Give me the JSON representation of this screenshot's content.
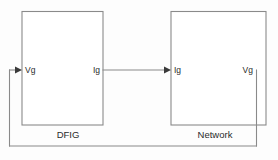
{
  "diagram": {
    "type": "block-diagram",
    "background_color": "#fdfdfd",
    "line_color": "#8a8a8a",
    "text_color": "#2b2b2b",
    "arrow_color": "#3a3a3a",
    "blocks": [
      {
        "id": "dfig",
        "caption": "DFIG",
        "ports": {
          "input_label": "Vg",
          "output_label": "Ig"
        }
      },
      {
        "id": "network",
        "caption": "Network",
        "ports": {
          "input_label": "Ig",
          "output_label": "Vg"
        }
      }
    ],
    "connections": [
      {
        "id": "forward",
        "label": "Ig",
        "from": "dfig",
        "to": "network",
        "direction": "left-to-right",
        "arrow": true
      },
      {
        "id": "feedback",
        "label": "Vg",
        "from": "network",
        "to": "dfig",
        "direction": "right-to-left",
        "arrow": true
      }
    ]
  }
}
